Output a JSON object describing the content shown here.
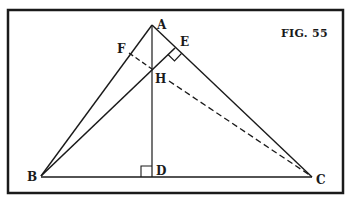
{
  "figure": {
    "caption": "FIG. 55",
    "border": {
      "x": 8,
      "y": 10,
      "w": 335,
      "h": 183,
      "stroke_width": 2.5
    },
    "colors": {
      "ink": "#1a1a1a",
      "background": "#ffffff"
    }
  },
  "points": {
    "A": {
      "label": "A",
      "x": 152,
      "y": 25
    },
    "B": {
      "label": "B",
      "x": 41,
      "y": 176
    },
    "C": {
      "label": "C",
      "x": 312,
      "y": 177
    },
    "D": {
      "label": "D",
      "x": 152,
      "y": 177
    },
    "E": {
      "label": "E",
      "x": 175,
      "y": 48
    },
    "F": {
      "label": "F",
      "x": 129,
      "y": 53
    },
    "H": {
      "label": "H",
      "x": 152,
      "y": 69
    }
  },
  "segments": {
    "solid": [
      "AB",
      "AC",
      "BC",
      "AD",
      "BE"
    ],
    "dashed": [
      "FH",
      "HC"
    ]
  },
  "right_angles": [
    "D",
    "E"
  ]
}
